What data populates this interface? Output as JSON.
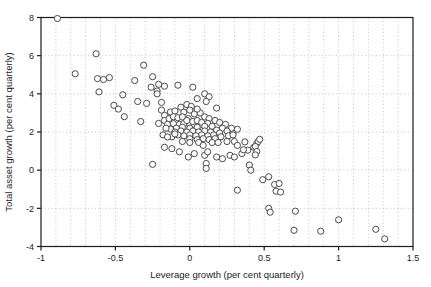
{
  "figure": {
    "background": "#ffffff",
    "axis_color": "#1c1c1c",
    "text_color": "#1c1c1c"
  },
  "chart_data": {
    "type": "scatter",
    "title": "",
    "xlabel": "Leverage growth (per cent quarterly)",
    "ylabel": "Total asset growth (per cent quarterly)",
    "xlim": [
      -1,
      1.5
    ],
    "ylim": [
      -4,
      8
    ],
    "xticks": [
      -1,
      -0.5,
      0,
      0.5,
      1,
      1.5
    ],
    "xtick_labels": [
      "-1",
      "-0.5",
      "0",
      "0.5",
      "1",
      "1.5"
    ],
    "yticks": [
      -4,
      -2,
      0,
      2,
      4,
      6,
      8
    ],
    "ytick_labels": [
      "-4",
      "-2",
      "0",
      "2",
      "4",
      "6",
      "8"
    ],
    "grid": {
      "style": "dotted",
      "color": "#c3c3c3",
      "x_interval": 0.1,
      "y_interval": 2
    },
    "legend": "none",
    "marker": {
      "shape": "open-circle",
      "radius": 3.1,
      "fill": "#fbfbfb",
      "stroke": "#4d4d4d"
    },
    "points": [
      [
        -0.89,
        7.95
      ],
      [
        -0.77,
        5.05
      ],
      [
        -0.63,
        6.1
      ],
      [
        -0.62,
        4.8
      ],
      [
        -0.58,
        4.75
      ],
      [
        -0.54,
        4.85
      ],
      [
        -0.61,
        4.1
      ],
      [
        -0.45,
        3.95
      ],
      [
        -0.51,
        3.4
      ],
      [
        -0.48,
        3.2
      ],
      [
        -0.44,
        2.8
      ],
      [
        -0.37,
        4.7
      ],
      [
        -0.35,
        3.6
      ],
      [
        -0.31,
        5.5
      ],
      [
        -0.29,
        3.5
      ],
      [
        -0.26,
        4.35
      ],
      [
        -0.25,
        4.9
      ],
      [
        -0.22,
        4.15
      ],
      [
        -0.21,
        4.5
      ],
      [
        -0.17,
        4.4
      ],
      [
        -0.22,
        4.0
      ],
      [
        -0.33,
        2.55
      ],
      [
        -0.21,
        2.45
      ],
      [
        -0.19,
        3.15
      ],
      [
        -0.19,
        3.55
      ],
      [
        -0.25,
        0.3
      ],
      [
        -0.17,
        1.2
      ],
      [
        -0.18,
        1.85
      ],
      [
        -0.08,
        4.45
      ],
      [
        0.02,
        4.35
      ],
      [
        0.1,
        4.0
      ],
      [
        0.13,
        3.85
      ],
      [
        0.05,
        3.75
      ],
      [
        0.11,
        3.6
      ],
      [
        0.18,
        3.25
      ],
      [
        -0.12,
        1.13
      ],
      [
        -0.07,
        0.96
      ],
      [
        -0.01,
        0.69
      ],
      [
        0.03,
        0.87
      ],
      [
        0.1,
        0.78
      ],
      [
        0.12,
        0.96
      ],
      [
        0.18,
        0.69
      ],
      [
        0.22,
        0.6
      ],
      [
        0.27,
        0.78
      ],
      [
        0.3,
        0.69
      ],
      [
        0.35,
        0.87
      ],
      [
        0.39,
        1.05
      ],
      [
        0.11,
        0.35
      ],
      [
        0.11,
        0.09
      ],
      [
        0.4,
        0.27
      ],
      [
        0.41,
        0.0
      ],
      [
        0.37,
        1.48
      ],
      [
        0.43,
        1.2
      ],
      [
        0.45,
        1.4
      ],
      [
        0.46,
        1.5
      ],
      [
        0.47,
        1.62
      ],
      [
        0.44,
        1.24
      ],
      [
        0.45,
        0.98
      ],
      [
        0.44,
        0.8
      ],
      [
        0.36,
        1.07
      ],
      [
        0.3,
        1.5
      ],
      [
        0.32,
        1.3
      ],
      [
        0.29,
        1.95
      ],
      [
        0.32,
        -1.05
      ],
      [
        0.49,
        -0.5
      ],
      [
        0.53,
        -0.35
      ],
      [
        0.57,
        -0.75
      ],
      [
        0.6,
        -0.7
      ],
      [
        0.58,
        -1.1
      ],
      [
        0.61,
        -1.15
      ],
      [
        0.53,
        -2.0
      ],
      [
        0.54,
        -2.2
      ],
      [
        0.71,
        -2.15
      ],
      [
        0.7,
        -3.15
      ],
      [
        0.88,
        -3.2
      ],
      [
        1.0,
        -2.6
      ],
      [
        1.25,
        -3.1
      ],
      [
        1.31,
        -3.6
      ],
      [
        -0.06,
        3.3
      ],
      [
        -0.02,
        3.44
      ],
      [
        0.01,
        3.34
      ],
      [
        -0.13,
        3.05
      ],
      [
        -0.1,
        3.1
      ],
      [
        -0.04,
        3.04
      ],
      [
        0.03,
        2.95
      ],
      [
        0.07,
        3.0
      ],
      [
        0.0,
        3.15
      ],
      [
        0.05,
        3.2
      ],
      [
        -0.17,
        2.87
      ],
      [
        -0.17,
        2.6
      ],
      [
        -0.14,
        2.7
      ],
      [
        -0.11,
        2.8
      ],
      [
        -0.08,
        2.75
      ],
      [
        -0.05,
        2.79
      ],
      [
        -0.01,
        2.7
      ],
      [
        0.1,
        2.79
      ],
      [
        0.13,
        2.7
      ],
      [
        0.17,
        2.6
      ],
      [
        0.2,
        2.5
      ],
      [
        0.24,
        2.4
      ],
      [
        0.28,
        2.2
      ],
      [
        0.32,
        2.14
      ],
      [
        -0.15,
        2.4
      ],
      [
        -0.11,
        2.44
      ],
      [
        -0.07,
        2.4
      ],
      [
        -0.04,
        2.44
      ],
      [
        0.0,
        2.37
      ],
      [
        0.03,
        2.4
      ],
      [
        0.07,
        2.37
      ],
      [
        -0.02,
        2.6
      ],
      [
        0.02,
        2.55
      ],
      [
        0.05,
        2.6
      ],
      [
        0.08,
        2.5
      ],
      [
        0.12,
        2.45
      ],
      [
        0.15,
        2.3
      ],
      [
        0.1,
        2.3
      ],
      [
        0.05,
        2.25
      ],
      [
        0.0,
        2.2
      ],
      [
        -0.05,
        2.25
      ],
      [
        -0.09,
        2.2
      ],
      [
        -0.13,
        2.15
      ],
      [
        -0.16,
        2.2
      ],
      [
        -0.1,
        2.0
      ],
      [
        -0.06,
        2.05
      ],
      [
        -0.02,
        2.0
      ],
      [
        0.02,
        2.05
      ],
      [
        0.06,
        2.0
      ],
      [
        0.1,
        2.05
      ],
      [
        0.14,
        2.0
      ],
      [
        0.18,
        2.1
      ],
      [
        0.22,
        2.2
      ],
      [
        0.25,
        2.05
      ],
      [
        0.2,
        1.95
      ],
      [
        0.16,
        1.85
      ],
      [
        0.12,
        1.8
      ],
      [
        0.08,
        1.85
      ],
      [
        0.04,
        1.8
      ],
      [
        0.0,
        1.85
      ],
      [
        -0.04,
        1.8
      ],
      [
        -0.08,
        1.85
      ],
      [
        -0.12,
        1.75
      ],
      [
        -0.15,
        1.74
      ],
      [
        -0.1,
        1.9
      ],
      [
        0.21,
        1.75
      ],
      [
        0.26,
        1.8
      ],
      [
        0.29,
        1.85
      ],
      [
        0.0,
        1.65
      ],
      [
        0.05,
        1.6
      ],
      [
        0.09,
        1.65
      ],
      [
        0.13,
        1.6
      ],
      [
        0.17,
        1.65
      ],
      [
        0.06,
        1.45
      ],
      [
        0.09,
        1.3
      ],
      [
        0.15,
        1.45
      ],
      [
        0.19,
        1.45
      ],
      [
        0.25,
        1.5
      ],
      [
        0.0,
        1.45
      ],
      [
        -0.05,
        1.5
      ]
    ]
  }
}
